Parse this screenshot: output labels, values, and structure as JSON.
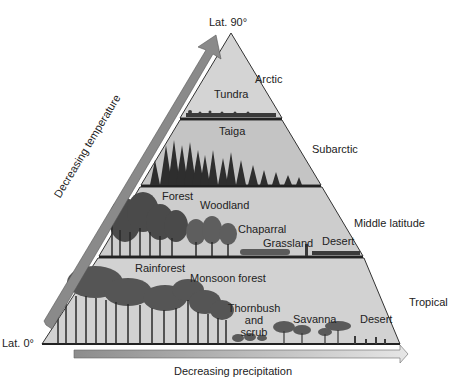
{
  "apex_label": "Lat. 90°",
  "base_label": "Lat. 0°",
  "axes": {
    "vertical_arrow": "Decreasing temperature",
    "horizontal_arrow": "Decreasing precipitation"
  },
  "zones": [
    {
      "name": "Arctic",
      "biomes": [
        "Tundra"
      ]
    },
    {
      "name": "Subarctic",
      "biomes": [
        "Taiga"
      ]
    },
    {
      "name": "Middle latitude",
      "biomes": [
        "Forest",
        "Woodland",
        "Chaparral",
        "Grassland",
        "Desert"
      ]
    },
    {
      "name": "Tropical",
      "biomes": [
        "Rainforest",
        "Monsoon forest",
        "Thornbush and scrub",
        "Savanna",
        "Desert"
      ]
    }
  ],
  "labels": {
    "tundra": "Tundra",
    "taiga": "Taiga",
    "forest": "Forest",
    "woodland": "Woodland",
    "chaparral": "Chaparral",
    "grassland": "Grassland",
    "desert_mid": "Desert",
    "rainforest": "Rainforest",
    "monsoon": "Monsoon forest",
    "thornbush1": "Thornbush",
    "thornbush2": "and",
    "thornbush3": "scrub",
    "savanna": "Savanna",
    "desert_trop": "Desert",
    "arctic": "Arctic",
    "subarctic": "Subarctic",
    "middle": "Middle latitude",
    "tropical": "Tropical"
  },
  "colors": {
    "band_fill": "#cfcfcf",
    "arrow_fill": "#8a8a8a",
    "outline": "#333333",
    "vegetation": "#3a3a3a"
  }
}
